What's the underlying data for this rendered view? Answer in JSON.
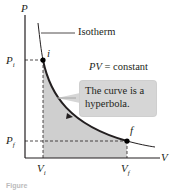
{
  "diagram": {
    "type": "pv-diagram",
    "axes": {
      "y_label": "P",
      "x_label": "V"
    },
    "ticks": {
      "p_initial": "P",
      "p_initial_sub": "i",
      "p_final": "P",
      "p_final_sub": "f",
      "v_initial": "V",
      "v_initial_sub": "i",
      "v_final": "V",
      "v_final_sub": "f"
    },
    "points": [
      {
        "id": "i",
        "label": "i"
      },
      {
        "id": "f",
        "label": "f"
      }
    ],
    "curve_label": "Isotherm",
    "equation": {
      "lhs": "PV",
      "rhs": "= constant"
    },
    "callout": {
      "line1": "The curve is a",
      "line2": "hyperbola."
    },
    "caption": "Figure",
    "colors": {
      "curve": "#231f20",
      "shaded_area": "#cfcfcf",
      "callout_bg": "#d6d6d6",
      "point": "#000000",
      "arrow_fill": "#ffffff"
    }
  }
}
